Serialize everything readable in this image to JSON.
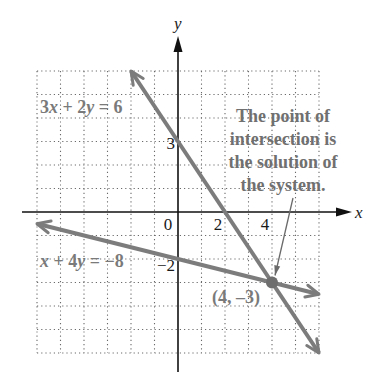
{
  "chart_data": {
    "type": "line",
    "title": "",
    "xlabel": "x",
    "ylabel": "y",
    "xlim": [
      -6,
      6
    ],
    "ylim": [
      -6,
      6
    ],
    "grid": true,
    "grid_style": "dotted",
    "x_tick_labels": [
      {
        "value": 0,
        "label": "0"
      },
      {
        "value": 2,
        "label": "2"
      },
      {
        "value": 4,
        "label": "4"
      }
    ],
    "y_tick_labels": [
      {
        "value": 3,
        "label": "3"
      },
      {
        "value": -2,
        "label": "−2"
      }
    ],
    "series": [
      {
        "name": "3x + 2y = 6",
        "equation": {
          "a": 3,
          "b": 2,
          "c": 6
        },
        "x_range": [
          -2,
          6
        ],
        "points": [
          [
            -2,
            6
          ],
          [
            0,
            3
          ],
          [
            2,
            0
          ],
          [
            4,
            -3
          ],
          [
            6,
            -6
          ]
        ],
        "color": "#7c7c7c",
        "label_parts": [
          {
            "t": "3",
            "v": false
          },
          {
            "t": "x",
            "v": true
          },
          {
            "t": " + 2",
            "v": false
          },
          {
            "t": "y",
            "v": true
          },
          {
            "t": " = 6",
            "v": false
          }
        ]
      },
      {
        "name": "x + 4y = −8",
        "equation": {
          "a": 1,
          "b": 4,
          "c": -8
        },
        "x_range": [
          -6,
          6
        ],
        "points": [
          [
            -6,
            -0.5
          ],
          [
            0,
            -2
          ],
          [
            4,
            -3
          ],
          [
            6,
            -3.5
          ]
        ],
        "color": "#7c7c7c",
        "label_parts": [
          {
            "t": "x",
            "v": true
          },
          {
            "t": " + 4",
            "v": false
          },
          {
            "t": "y",
            "v": true
          },
          {
            "t": " = −8",
            "v": false
          }
        ]
      }
    ],
    "intersection": {
      "x": 4,
      "y": -3,
      "label": "(4, –3)",
      "color": "#6e6e6e"
    },
    "annotations": [
      {
        "text_lines": [
          "The point of",
          "intersection is",
          "the solution of",
          "the system."
        ],
        "points_to": [
          4,
          -3
        ]
      }
    ]
  }
}
